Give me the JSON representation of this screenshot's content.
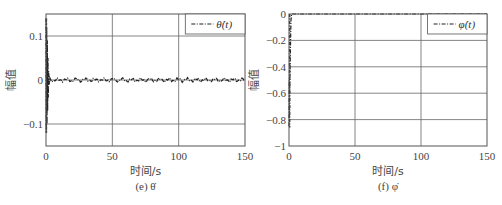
{
  "chart_data": [
    {
      "type": "line",
      "title": "",
      "caption": "(e) θ̇",
      "caption_label": "(e)",
      "caption_symbol": "θ̇",
      "xlabel": "时间/s",
      "ylabel": "幅值",
      "xlim": [
        0,
        150
      ],
      "ylim": [
        -0.15,
        0.15
      ],
      "xticks": [
        0,
        50,
        100,
        150
      ],
      "xtick_labels": [
        "0",
        "50",
        "100",
        "150"
      ],
      "yticks": [
        -0.1,
        0,
        0.1
      ],
      "ytick_labels": [
        "−0.1",
        "0",
        "0.1"
      ],
      "grid": true,
      "legend": {
        "position": "top-right",
        "entries": [
          "θ̇(t)"
        ]
      },
      "series": [
        {
          "name": "θ̇(t)",
          "style": "dash-dot",
          "description": "initial spike between about -0.12 and 0.14 near t=0, then small oscillation around 0 (amplitude ~0.005)",
          "x": [
            0,
            0.3,
            0.6,
            0.9,
            1.2,
            1.5,
            2,
            3,
            5,
            10,
            20,
            30,
            40,
            50,
            60,
            70,
            80,
            90,
            100,
            110,
            120,
            130,
            140,
            150
          ],
          "y": [
            0.14,
            -0.12,
            0.1,
            -0.08,
            0.05,
            -0.03,
            0.01,
            -0.005,
            0.004,
            -0.003,
            0.003,
            -0.003,
            0.003,
            -0.003,
            0.003,
            -0.003,
            0.003,
            -0.003,
            0.003,
            -0.003,
            0.003,
            -0.003,
            0.003,
            -0.002
          ]
        }
      ]
    },
    {
      "type": "line",
      "title": "",
      "caption": "(f) φ̇",
      "caption_label": "(f)",
      "caption_symbol": "φ̇",
      "xlabel": "时间/s",
      "ylabel": "幅值",
      "xlim": [
        0,
        150
      ],
      "ylim": [
        -1,
        0
      ],
      "xticks": [
        0,
        50,
        100,
        150
      ],
      "xtick_labels": [
        "0",
        "50",
        "100",
        "150"
      ],
      "yticks": [
        -1,
        -0.8,
        -0.6,
        -0.4,
        -0.2,
        0
      ],
      "ytick_labels": [
        "−1",
        "−0.8",
        "−0.6",
        "−0.4",
        "−0.2",
        "0"
      ],
      "grid": true,
      "legend": {
        "position": "top-right",
        "entries": [
          "φ̇(t)"
        ]
      },
      "series": [
        {
          "name": "φ̇(t)",
          "style": "dash-dot",
          "description": "initial drop near t=0 from about -0.85 back up to 0, then stays at 0",
          "x": [
            0,
            0.5,
            1,
            1.5,
            2,
            5,
            50,
            100,
            150
          ],
          "y": [
            -0.85,
            -0.6,
            -0.3,
            -0.05,
            0,
            0,
            0,
            0,
            0
          ]
        }
      ]
    }
  ]
}
